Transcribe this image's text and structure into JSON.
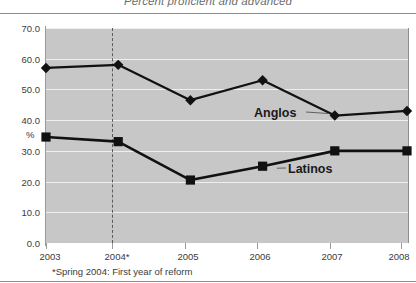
{
  "chart_data": {
    "type": "line",
    "title": "Percent proficient and advanced",
    "xlabel": "",
    "ylabel": "%",
    "categories": [
      "2003",
      "2004*",
      "2005",
      "2006",
      "2007",
      "2008"
    ],
    "series": [
      {
        "name": "Anglos",
        "marker": "diamond",
        "values": [
          57,
          58,
          46.5,
          53,
          41.5,
          43
        ]
      },
      {
        "name": "Latinos",
        "marker": "square",
        "values": [
          34.5,
          33,
          20.5,
          25,
          30,
          30
        ]
      }
    ],
    "ylim": [
      0,
      70
    ],
    "yticks": [
      "0.0",
      "10.0",
      "20.0",
      "30.0",
      "40.0",
      "50.0",
      "60.0",
      "70.0"
    ],
    "ytick_values": [
      0,
      10,
      20,
      30,
      40,
      50,
      60,
      70
    ],
    "grid": true,
    "grid_color": "#efefef",
    "plot_background": "#c7c7c7",
    "legend": "inline-annotations",
    "annotations": [
      {
        "text": "Anglos",
        "points_to": "2007 Anglos point"
      },
      {
        "text": "Latinos",
        "points_to": "2007 Latinos point"
      }
    ],
    "reference_line": {
      "at": "2004*",
      "style": "dashed",
      "color": "#5b5b5b"
    },
    "footnote": "*Spring 2004: First year of reform",
    "line_color": "#111111"
  },
  "axis": {
    "y_label": "%",
    "y_ticks": [
      "70.0",
      "60.0",
      "50.0",
      "40.0",
      "30.0",
      "20.0",
      "10.0",
      "0.0"
    ],
    "x_ticks": [
      "2003",
      "2004*",
      "2005",
      "2006",
      "2007",
      "2008"
    ]
  },
  "labels": {
    "anglos": "Anglos",
    "latinos": "Latinos"
  },
  "footnote": {
    "text": "*Spring 2004: First year of reform"
  }
}
